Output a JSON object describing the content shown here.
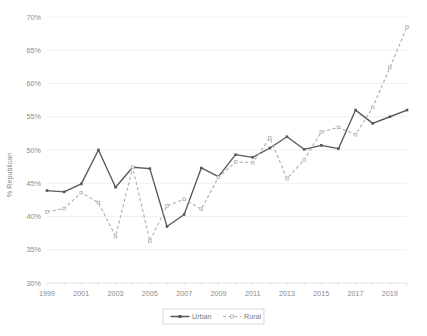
{
  "chart_data": {
    "type": "line",
    "title": "",
    "xlabel": "",
    "ylabel": "% Republican",
    "ylim": [
      30,
      70
    ],
    "ytick_step": 5,
    "ytick_labels": [
      "30%",
      "35%",
      "40%",
      "45%",
      "50%",
      "55%",
      "60%",
      "65%",
      "70%"
    ],
    "ytick_values": [
      30,
      35,
      40,
      45,
      50,
      55,
      60,
      65,
      70
    ],
    "grid": true,
    "legend_position": "bottom",
    "x": [
      1999,
      2000,
      2001,
      2002,
      2003,
      2004,
      2005,
      2006,
      2007,
      2008,
      2009,
      2010,
      2011,
      2012,
      2013,
      2014,
      2015,
      2016,
      2017,
      2018,
      2019,
      2020
    ],
    "xtick_labels": [
      "1999",
      "2001",
      "2003",
      "2005",
      "2007",
      "2009",
      "2011",
      "2013",
      "2015",
      "2017",
      "2019"
    ],
    "xtick_label_values": [
      1999,
      2001,
      2003,
      2005,
      2007,
      2009,
      2011,
      2013,
      2015,
      2017,
      2019
    ],
    "xlim": [
      1999,
      2020
    ],
    "series": [
      {
        "name": "Urban",
        "style": "solid",
        "color": "#595959",
        "marker": "square",
        "values": [
          43.9,
          43.7,
          44.9,
          50.0,
          44.4,
          47.4,
          47.2,
          38.5,
          40.3,
          47.3,
          46.0,
          49.3,
          48.9,
          50.3,
          52.0,
          50.1,
          50.7,
          50.2,
          56.0,
          54.0,
          55.0,
          56.0
        ]
      },
      {
        "name": "Rural",
        "style": "dashed",
        "color": "#b0b0b0",
        "marker": "square",
        "values": [
          40.7,
          41.2,
          43.6,
          42.1,
          37.0,
          47.4,
          36.3,
          41.6,
          42.6,
          41.1,
          45.9,
          48.2,
          48.1,
          51.8,
          45.7,
          48.5,
          52.7,
          53.4,
          52.3,
          56.4,
          62.4,
          68.5
        ]
      }
    ]
  },
  "axes": {
    "y_title": "% Republican",
    "y_ticks": [
      "70%",
      "65%",
      "60%",
      "55%",
      "50%",
      "45%",
      "40%",
      "35%",
      "30%"
    ],
    "x_ticks": [
      "1999",
      "2001",
      "2003",
      "2005",
      "2007",
      "2009",
      "2011",
      "2013",
      "2015",
      "2017",
      "2019"
    ]
  },
  "legend": {
    "items": [
      {
        "label": "Urban",
        "color": "#595959",
        "style": "solid"
      },
      {
        "label": "Rural",
        "color": "#b0b0b0",
        "style": "dashed"
      }
    ]
  },
  "colors": {
    "urban": "#595959",
    "rural": "#b0b0b0",
    "grid": "#e8e8e8",
    "text": "#8a8a8a",
    "background": "#ffffff"
  }
}
